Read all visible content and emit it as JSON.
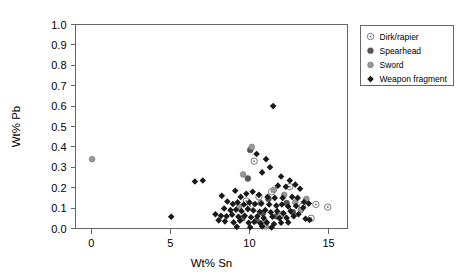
{
  "chart_data": {
    "type": "scatter",
    "title": "",
    "xlabel": "Wt% Sn",
    "ylabel": "Wt% Pb",
    "xlim": [
      -1.0,
      16.2
    ],
    "ylim": [
      0.0,
      1.0
    ],
    "xticks": [
      0,
      5,
      10,
      15
    ],
    "xtick_labels": [
      "0",
      "5",
      "10",
      "15"
    ],
    "yticks": [
      0.0,
      0.1,
      0.2,
      0.3,
      0.4,
      0.5,
      0.6,
      0.7,
      0.8,
      0.9,
      1.0
    ],
    "ytick_labels": [
      "0.0",
      "0.1",
      "0.2",
      "0.3",
      "0.4",
      "0.5",
      "0.6",
      "0.7",
      "0.8",
      "0.9",
      "1.0"
    ],
    "grid": false,
    "legend_position": "top-right-outside",
    "series": [
      {
        "name": "Dirk/rapier",
        "marker": "open-circle-dot",
        "color": "#777777",
        "points": [
          [
            10.3,
            0.33
          ],
          [
            12.55,
            0.205
          ],
          [
            10.6,
            0.155
          ],
          [
            9.8,
            0.135
          ],
          [
            11.4,
            0.18
          ],
          [
            10.05,
            0.11
          ],
          [
            13.35,
            0.11
          ],
          [
            14.2,
            0.118
          ],
          [
            12.1,
            0.07
          ],
          [
            13.9,
            0.05
          ],
          [
            14.95,
            0.105
          ]
        ]
      },
      {
        "name": "Spearhead",
        "marker": "filled-circle-dark",
        "color": "#555555",
        "points": [
          [
            10.05,
            0.385
          ],
          [
            9.9,
            0.245
          ],
          [
            11.2,
            0.145
          ],
          [
            12.35,
            0.125
          ],
          [
            11.7,
            0.06
          ],
          [
            10.85,
            0.075
          ],
          [
            12.75,
            0.08
          ],
          [
            10.45,
            0.04
          ],
          [
            9.55,
            0.05
          ]
        ]
      },
      {
        "name": "Sword",
        "marker": "filled-circle-gray",
        "color": "#999999",
        "points": [
          [
            0.05,
            0.34
          ],
          [
            10.15,
            0.4
          ],
          [
            9.6,
            0.265
          ],
          [
            11.55,
            0.19
          ],
          [
            10.7,
            0.125
          ],
          [
            12.9,
            0.128
          ],
          [
            13.25,
            0.09
          ],
          [
            11.95,
            0.063
          ],
          [
            10.95,
            0.035
          ],
          [
            9.35,
            0.105
          ],
          [
            12.2,
            0.165
          ],
          [
            13.6,
            0.145
          ],
          [
            11.05,
            0.01
          ]
        ]
      },
      {
        "name": "Weapon fragment",
        "marker": "filled-diamond-black",
        "color": "#1a1a1a",
        "points": [
          [
            11.5,
            0.6
          ],
          [
            10.45,
            0.365
          ],
          [
            11.05,
            0.34
          ],
          [
            11.3,
            0.3
          ],
          [
            10.8,
            0.275
          ],
          [
            12.0,
            0.255
          ],
          [
            12.55,
            0.235
          ],
          [
            11.8,
            0.21
          ],
          [
            6.55,
            0.23
          ],
          [
            7.05,
            0.235
          ],
          [
            12.3,
            0.205
          ],
          [
            12.9,
            0.215
          ],
          [
            13.2,
            0.195
          ],
          [
            9.1,
            0.185
          ],
          [
            8.25,
            0.16
          ],
          [
            9.45,
            0.155
          ],
          [
            9.8,
            0.17
          ],
          [
            10.2,
            0.18
          ],
          [
            10.6,
            0.165
          ],
          [
            11.15,
            0.155
          ],
          [
            11.6,
            0.15
          ],
          [
            12.1,
            0.15
          ],
          [
            12.7,
            0.155
          ],
          [
            13.05,
            0.15
          ],
          [
            13.45,
            0.13
          ],
          [
            13.75,
            0.122
          ],
          [
            8.6,
            0.132
          ],
          [
            8.95,
            0.12
          ],
          [
            9.25,
            0.128
          ],
          [
            9.65,
            0.118
          ],
          [
            10.0,
            0.128
          ],
          [
            10.35,
            0.12
          ],
          [
            10.75,
            0.122
          ],
          [
            11.25,
            0.118
          ],
          [
            11.7,
            0.112
          ],
          [
            12.05,
            0.118
          ],
          [
            12.45,
            0.108
          ],
          [
            12.95,
            0.11
          ],
          [
            13.4,
            0.102
          ],
          [
            8.4,
            0.098
          ],
          [
            8.8,
            0.09
          ],
          [
            9.15,
            0.092
          ],
          [
            9.5,
            0.085
          ],
          [
            9.9,
            0.095
          ],
          [
            10.25,
            0.088
          ],
          [
            10.65,
            0.082
          ],
          [
            11.0,
            0.09
          ],
          [
            11.35,
            0.08
          ],
          [
            11.75,
            0.085
          ],
          [
            12.15,
            0.075
          ],
          [
            12.6,
            0.085
          ],
          [
            13.1,
            0.07
          ],
          [
            13.55,
            0.048
          ],
          [
            13.8,
            0.042
          ],
          [
            7.85,
            0.07
          ],
          [
            8.2,
            0.062
          ],
          [
            8.55,
            0.06
          ],
          [
            8.9,
            0.068
          ],
          [
            9.3,
            0.058
          ],
          [
            9.7,
            0.062
          ],
          [
            10.1,
            0.055
          ],
          [
            10.5,
            0.06
          ],
          [
            10.9,
            0.052
          ],
          [
            11.45,
            0.058
          ],
          [
            11.9,
            0.05
          ],
          [
            12.35,
            0.052
          ],
          [
            12.8,
            0.06
          ],
          [
            5.05,
            0.058
          ],
          [
            8.05,
            0.04
          ],
          [
            8.45,
            0.035
          ],
          [
            9.0,
            0.03
          ],
          [
            9.4,
            0.038
          ],
          [
            9.95,
            0.028
          ],
          [
            10.3,
            0.032
          ],
          [
            10.7,
            0.025
          ],
          [
            11.1,
            0.03
          ],
          [
            11.55,
            0.022
          ],
          [
            12.0,
            0.028
          ],
          [
            12.45,
            0.03
          ],
          [
            9.2,
            0.008
          ],
          [
            10.05,
            0.006
          ],
          [
            10.8,
            0.01
          ],
          [
            11.4,
            0.005
          ]
        ]
      }
    ]
  },
  "legend": {
    "entries": [
      {
        "label": "Dirk/rapier"
      },
      {
        "label": "Spearhead"
      },
      {
        "label": "Sword"
      },
      {
        "label": "Weapon fragment"
      }
    ]
  }
}
